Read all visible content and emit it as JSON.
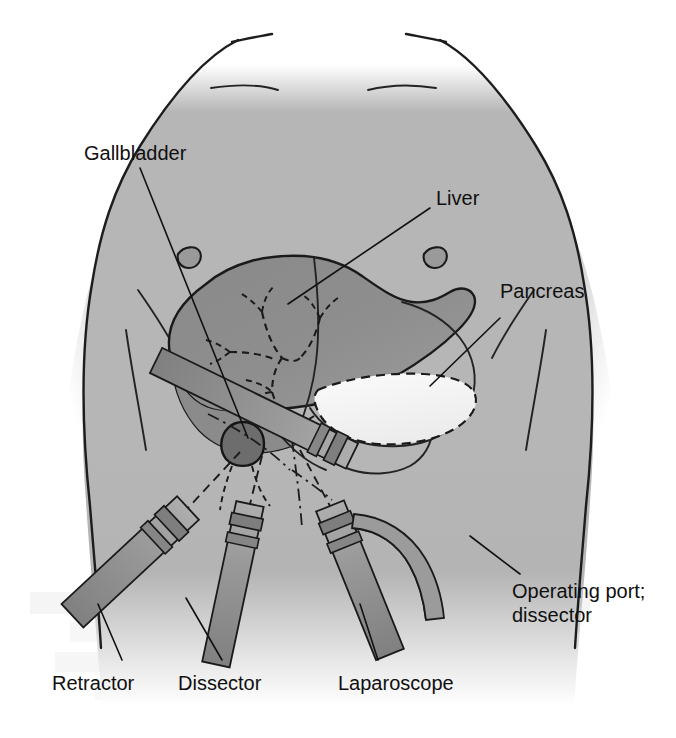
{
  "labels": {
    "gallbladder": "Gallbladder",
    "liver": "Liver",
    "pancreas": "Pancreas",
    "operating_port_line1": "Operating port;",
    "operating_port_line2": "dissector",
    "retractor": "Retractor",
    "dissector": "Dissector",
    "laparoscope": "Laparoscope"
  },
  "colors": {
    "background": "#ffffff",
    "skin_fill": "#b4b4b4",
    "skin_fill_light": "#bdbdbd",
    "liver_fill": "#8d8d8d",
    "liver_fill_dark": "#868686",
    "gallbladder_fill": "#6f6f6f",
    "pancreas_fill": "#f2f2f2",
    "stomach_fill": "#aaaaaa",
    "instrument_fill": "#8f8f8f",
    "instrument_fill_light": "#a6a6a6",
    "instrument_collar": "#7c7c7c",
    "outline": "#1a1a1a",
    "label_text": "#101010",
    "bleed_text": "#c8c8c8"
  },
  "anatomy": [
    {
      "name": "torso",
      "kind": "outline",
      "note": "anterior chest and abdomen, shoulders at top, fades to white at lower edge"
    },
    {
      "name": "left-nipple",
      "kind": "marker"
    },
    {
      "name": "right-nipple",
      "kind": "marker"
    },
    {
      "name": "clavicle-left",
      "kind": "line"
    },
    {
      "name": "clavicle-right",
      "kind": "line"
    },
    {
      "name": "costal-margin-left",
      "kind": "line"
    },
    {
      "name": "costal-margin-right",
      "kind": "line"
    },
    {
      "name": "liver",
      "kind": "organ",
      "shade": "dark-gray"
    },
    {
      "name": "gallbladder",
      "kind": "organ",
      "shade": "darkest-gray"
    },
    {
      "name": "biliary-tree",
      "kind": "ducts",
      "style": "dashed"
    },
    {
      "name": "stomach",
      "kind": "organ",
      "style": "solid-outline"
    },
    {
      "name": "pancreas",
      "kind": "organ",
      "shade": "near-white",
      "style": "dashed-outline"
    },
    {
      "name": "duodenum",
      "kind": "organ",
      "style": "solid-outline"
    }
  ],
  "instruments": [
    {
      "name": "retractor",
      "label": "Retractor",
      "entry": "left-lateral",
      "angle_deg": 57
    },
    {
      "name": "dissector",
      "label": "Dissector",
      "entry": "left-paramedian",
      "angle_deg": 78
    },
    {
      "name": "laparoscope",
      "label": "Laparoscope",
      "entry": "umbilical-midline",
      "angle_deg": 70
    },
    {
      "name": "operating-port-dissector",
      "label": "Operating port; dissector",
      "entry": "right-subcostal",
      "angle_deg": 25
    }
  ],
  "bleed_through": {
    "present": true,
    "note": "faint reverse-page text showing through the paper at lower left",
    "lines": [
      "",
      "",
      ""
    ]
  }
}
